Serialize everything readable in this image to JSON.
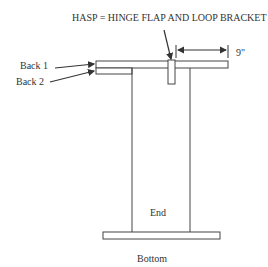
{
  "diagram": {
    "title": "HASP = HINGE FLAP AND LOOP BRACKET",
    "labels": {
      "back1": "Back 1",
      "back2": "Back 2",
      "dimension": "9\"",
      "end": "End",
      "bottom": "Bottom"
    },
    "colors": {
      "stroke": "#444444",
      "text": "#333333",
      "background": "#ffffff"
    }
  }
}
